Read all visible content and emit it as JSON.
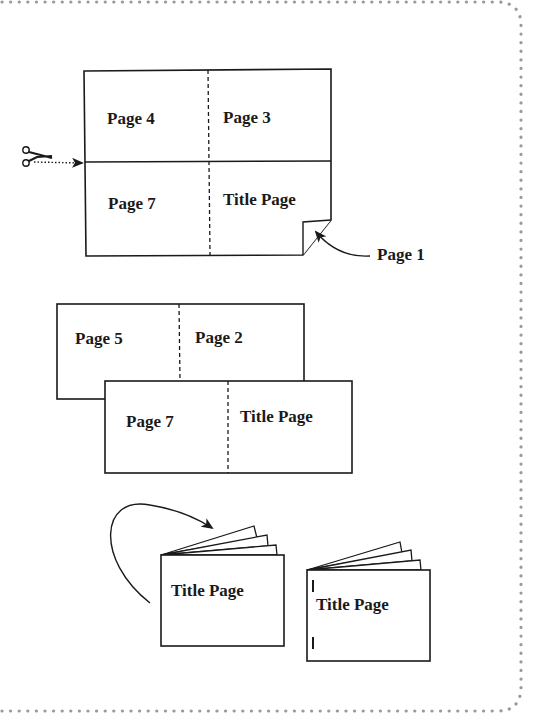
{
  "diagram": {
    "step1": {
      "sheet": {
        "top_left": "Page 4",
        "top_right": "Page 3",
        "bottom_left": "Page 7",
        "bottom_right": "Title Page"
      },
      "cut_icon": "scissors-icon",
      "callout": "Page 1"
    },
    "step2": {
      "back_sheet": {
        "left": "Page 5",
        "right": "Page 2"
      },
      "front_sheet": {
        "left": "Page 7",
        "right": "Title Page"
      }
    },
    "step3": {
      "booklet_folded": {
        "cover": "Title Page"
      },
      "booklet_stapled": {
        "cover": "Title Page"
      }
    },
    "colors": {
      "ink": "#1a1a1a",
      "border": "#9a9a9a",
      "background": "#ffffff"
    }
  }
}
